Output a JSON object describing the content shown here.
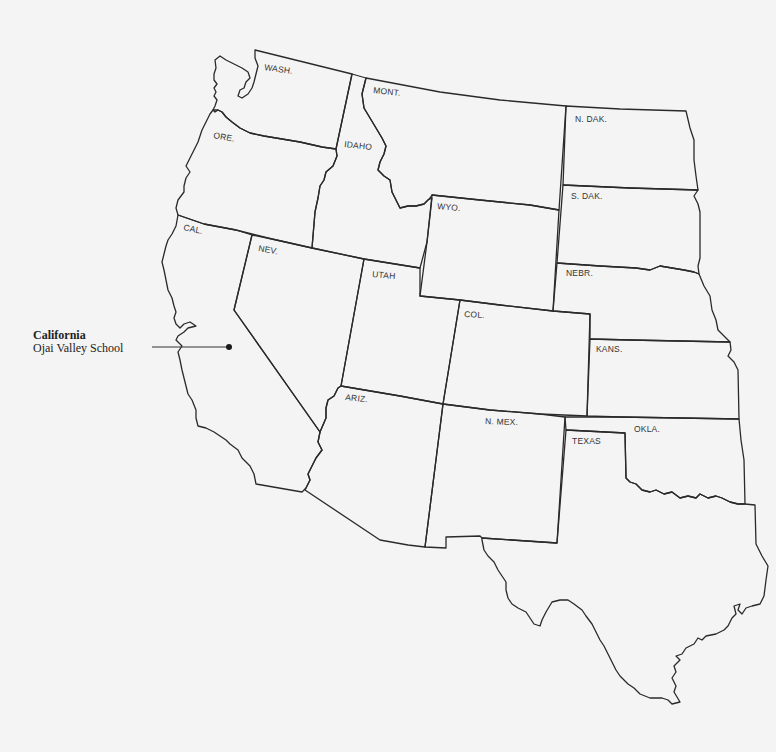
{
  "map": {
    "type": "outline-map",
    "region": "Western United States",
    "line_color": "#2a2a2a",
    "background_color": "#f4f4f4",
    "states": [
      {
        "id": "wash",
        "label": "WASH."
      },
      {
        "id": "ore",
        "label": "ORE."
      },
      {
        "id": "cal",
        "label": "CAL."
      },
      {
        "id": "nev",
        "label": "NEV."
      },
      {
        "id": "idaho",
        "label": "IDAHO"
      },
      {
        "id": "mont",
        "label": "MONT."
      },
      {
        "id": "wyo",
        "label": "WYO."
      },
      {
        "id": "utah",
        "label": "UTAH"
      },
      {
        "id": "ariz",
        "label": "ARIZ."
      },
      {
        "id": "col",
        "label": "COL."
      },
      {
        "id": "nmex",
        "label": "N. MEX."
      },
      {
        "id": "ndak",
        "label": "N. DAK."
      },
      {
        "id": "sdak",
        "label": "S. DAK."
      },
      {
        "id": "nebr",
        "label": "NEBR."
      },
      {
        "id": "kans",
        "label": "KANS."
      },
      {
        "id": "okla",
        "label": "OKLA."
      },
      {
        "id": "texas",
        "label": "TEXAS"
      }
    ],
    "markers": [
      {
        "state": "California",
        "title": "California",
        "subtitle": "Ojai Valley School",
        "marker_color": "#1a1a1a"
      }
    ]
  }
}
